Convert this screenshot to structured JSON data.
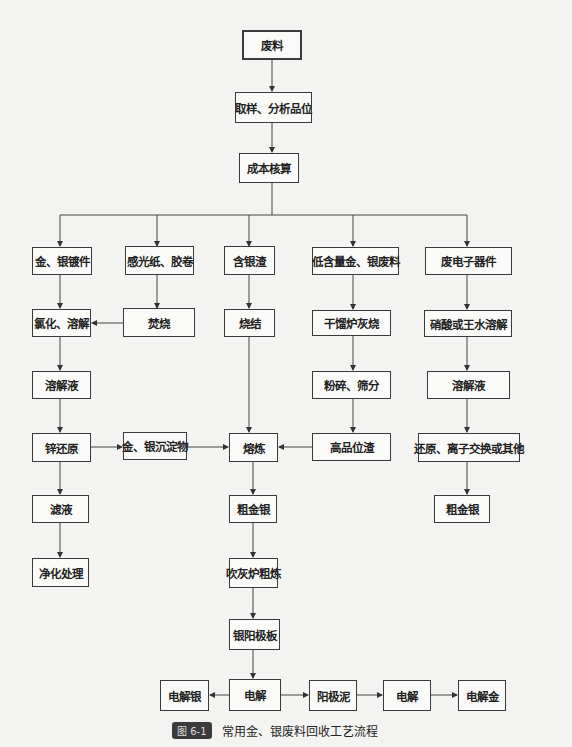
{
  "figure": {
    "number": "图 6-1",
    "caption": "常用金、银废料回收工艺流程"
  },
  "nodes": {
    "waste": "废料",
    "sampling": "取样、分析品位",
    "cost": "成本核算",
    "plated": "金、银镀件",
    "film": "感光纸、胶卷",
    "slag": "含银渣",
    "lowgrade": "低含量金、银废料",
    "ewaste": "废电子器件",
    "chlorinate": "氯化、溶解",
    "incinerate": "焚烧",
    "sinter": "烧结",
    "retort": "干馏炉灰烧",
    "acid": "硝酸或王水溶解",
    "solution_left": "溶解液",
    "crush": "粉碎、筛分",
    "solution_right": "溶解液",
    "zinc": "锌还原",
    "precipitate": "金、银沉淀物",
    "smelt": "熔炼",
    "highslag": "高品位渣",
    "reduce": "还原、离子交换或其他",
    "filtrate": "滤液",
    "crude_mid": "粗金银",
    "crude_right": "粗金银",
    "purify": "净化处理",
    "cupel": "吹灰炉粗炼",
    "anode": "银阳极板",
    "ag_product": "电解银",
    "electro1": "电解",
    "slime": "阳极泥",
    "electro2": "电解",
    "au_product": "电解金"
  }
}
